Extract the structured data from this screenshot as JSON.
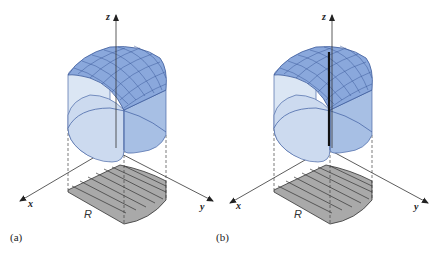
{
  "figure": {
    "panels": [
      {
        "id": "a",
        "caption": "(a)",
        "axis_labels": {
          "x": "x",
          "y": "y",
          "z": "z"
        },
        "region_label": "R",
        "has_vertical_rod": false
      },
      {
        "id": "b",
        "caption": "(b)",
        "axis_labels": {
          "x": "x",
          "y": "y",
          "z": "z"
        },
        "region_label": "R",
        "has_vertical_rod": true
      }
    ],
    "colors": {
      "surface_top": "#7f9fd6",
      "surface_mesh": "#3c5a9a",
      "side_light": "#dbe6f4",
      "side_mid": "#b7cbe8",
      "side_dark": "#93b0dc",
      "region_fill": "#a8a8a8",
      "axis": "#333333",
      "rod": "#111111"
    }
  }
}
